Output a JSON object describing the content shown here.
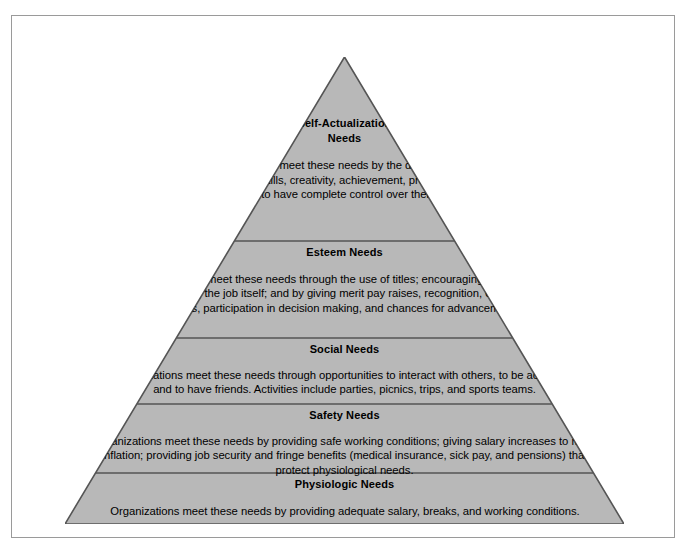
{
  "figure": {
    "colors": {
      "tier_fill": "#b8b8b8",
      "tier_outline": "#555555",
      "frame_border": "#9a9a9a",
      "text": "#000000",
      "background": "#ffffff"
    },
    "tiers": [
      {
        "id": "self-actualization",
        "title": "Self-Actualization\nNeeds",
        "title_line1": "Self-Actualization",
        "title_line2": "Needs",
        "body": "Organizations meet these needs by the development of employees' skills, creativity, achievement, promotions, and ability to have complete control over their jobs."
      },
      {
        "id": "esteem",
        "title": "Esteem Needs",
        "body": "Organizations meet these needs through the use of titles; encouraging satisfaction in completing the job itself; and by giving merit pay raises, recognition, challenging tasks, participation in decision making, and chances for advancement."
      },
      {
        "id": "social",
        "title": "Social Needs",
        "body": "Organizations meet these needs through opportunities to interact with others, to be accepted, and to have friends. Activities include parties, picnics, trips, and sports teams."
      },
      {
        "id": "safety",
        "title": "Safety Needs",
        "body": "Organizations meet these needs by providing safe working conditions; giving salary increases to meet inflation; providing job security and fringe benefits (medical insurance, sick pay, and pensions) that protect physiological needs."
      },
      {
        "id": "physiologic",
        "title": "Physiologic Needs",
        "body": "Organizations meet these needs by providing adequate salary, breaks, and working conditions."
      }
    ]
  }
}
